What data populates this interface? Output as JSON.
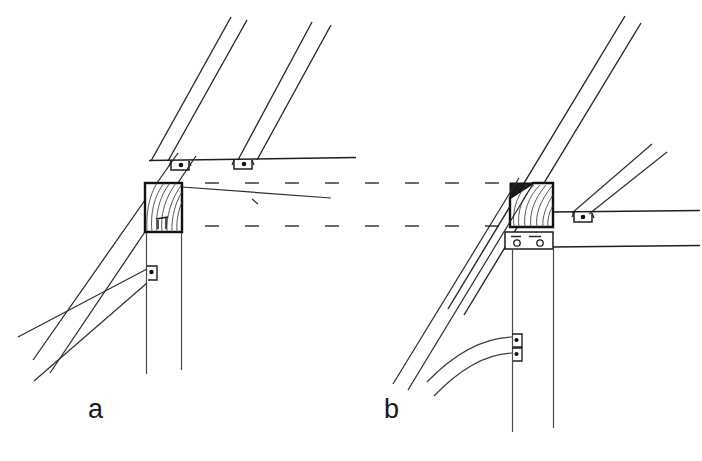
{
  "figure": {
    "kind": "technical-line-drawing",
    "background_color": "#ffffff",
    "line_color": "#1a1a1a",
    "thin_line_color": "#4a4a4a",
    "labels": [
      {
        "id": "a",
        "text": "a",
        "x": 95,
        "y": 412
      },
      {
        "id": "b",
        "text": "b",
        "x": 391,
        "y": 412
      }
    ],
    "panels": [
      {
        "id": "panel-a",
        "label": "a",
        "description": "Eaves detail without bracket plate: two rafters bearing on purlin, hatched beam end-section on post, diagonal brace bolted to post"
      },
      {
        "id": "panel-b",
        "label": "b",
        "description": "Eaves detail with steel bracket plate and curved knee brace bolted to post"
      }
    ],
    "annotations": {
      "hatched_box_meaning": "sawn timber cross-section with growth-ring end grain",
      "dashed_center_lines": "hidden / continuation lines linking the two details",
      "bolt_symbol": "small filled dot inside U-shaped shoe bracket"
    }
  },
  "geometry": {
    "panel_a": {
      "rafters": [
        {
          "name": "rafter-outer-upper",
          "x1": 231,
          "y1": 17,
          "x2": 152,
          "y2": 160
        },
        {
          "name": "rafter-outer-lower",
          "x1": 246,
          "y1": 20,
          "x2": 167,
          "y2": 160
        },
        {
          "name": "rafter-inner-upper",
          "x1": 311,
          "y1": 22,
          "x2": 238,
          "y2": 160
        },
        {
          "name": "rafter-inner-lower",
          "x1": 330,
          "y1": 24,
          "x2": 258,
          "y2": 160
        }
      ],
      "purlin_line": {
        "x1": 150,
        "y1": 160,
        "x2": 355,
        "y2": 157
      },
      "shoe_brackets": [
        {
          "cx": 180,
          "cy": 165,
          "w": 19,
          "h": 10
        },
        {
          "cx": 243,
          "cy": 164,
          "w": 19,
          "h": 10
        }
      ],
      "wall_line_upper": {
        "x1": 175,
        "y1": 155,
        "x2": 60,
        "y2": 360
      },
      "wall_line_lower": {
        "x1": 192,
        "y1": 158,
        "x2": 75,
        "y2": 368
      },
      "beam_box": {
        "x": 145,
        "y": 183,
        "w": 37,
        "h": 49
      },
      "beam_top_line": {
        "x1": 182,
        "y1": 188,
        "x2": 330,
        "y2": 199
      },
      "post_left": {
        "x": 146,
        "y1": 232,
        "y2": 372
      },
      "post_right": {
        "x": 182,
        "y1": 232,
        "y2": 370
      },
      "brace_upper": {
        "x1": 148,
        "y1": 270,
        "x2": 22,
        "y2": 337
      },
      "brace_lower": {
        "x1": 148,
        "y1": 283,
        "x2": 36,
        "y2": 379
      },
      "brace_bolt": {
        "cx": 151,
        "cy": 272,
        "w": 11,
        "h": 13
      }
    },
    "panel_b": {
      "rafters": [
        {
          "name": "rafter-outer-upper",
          "x1": 622,
          "y1": 17,
          "x2": 452,
          "y2": 308
        },
        {
          "name": "rafter-outer-lower",
          "x1": 637,
          "y1": 22,
          "x2": 467,
          "y2": 313
        },
        {
          "name": "rafter-inner-upper",
          "x1": 648,
          "y1": 145,
          "x2": 573,
          "y2": 212
        },
        {
          "name": "rafter-inner-lower",
          "x1": 662,
          "y1": 152,
          "x2": 588,
          "y2": 214
        }
      ],
      "purlin_line": {
        "x1": 553,
        "y1": 212,
        "x2": 700,
        "y2": 210
      },
      "shoe_brackets": [
        {
          "cx": 583,
          "cy": 217,
          "w": 19,
          "h": 10
        }
      ],
      "beam_box": {
        "x": 510,
        "y": 183,
        "w": 43,
        "h": 44
      },
      "beam_notch": {
        "x1": 510,
        "y1": 183,
        "x2": 533,
        "y2": 183,
        "x3": 510,
        "y3": 198
      },
      "bracket_plate": {
        "x": 505,
        "y": 232,
        "w": 47,
        "h": 17
      },
      "bracket_holes": [
        {
          "cx": 517,
          "cy": 242,
          "r": 3
        },
        {
          "cx": 540,
          "cy": 242,
          "r": 3
        }
      ],
      "bracket_dashes": [
        {
          "x1": 512,
          "y1": 236,
          "x2": 522,
          "y2": 236
        },
        {
          "x1": 530,
          "y1": 236,
          "x2": 542,
          "y2": 236
        }
      ],
      "plate_line_right": {
        "x1": 552,
        "y1": 247,
        "x2": 700,
        "y2": 245
      },
      "post_left": {
        "x": 512,
        "y1": 249,
        "y2": 430
      },
      "post_right": {
        "x": 553,
        "y1": 249,
        "y2": 428
      },
      "curved_brace_upper": {
        "sx": 512,
        "sy": 337,
        "cx": 460,
        "cy": 344,
        "ex": 428,
        "ey": 382
      },
      "curved_brace_lower": {
        "sx": 512,
        "sy": 352,
        "cx": 468,
        "cy": 362,
        "ex": 433,
        "ey": 394
      },
      "brace_bolts": [
        {
          "cx": 516,
          "cy": 340,
          "w": 11,
          "h": 12
        },
        {
          "cx": 516,
          "cy": 353,
          "w": 11,
          "h": 12
        }
      ]
    },
    "hidden_lines": {
      "row_upper_y": 183,
      "row_lower_y": 226,
      "x_start": 205,
      "x_end": 500,
      "dash_pattern": "14 26"
    }
  }
}
